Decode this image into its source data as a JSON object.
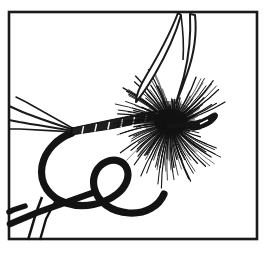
{
  "image": {
    "title": "Dry fly tied on hook",
    "subject": "fishing fly",
    "style": "black and white pen-and-ink line illustration",
    "background_color": "#ffffff",
    "ink_color": "#1a1a1a",
    "width": 272,
    "height": 255
  },
  "frame": {
    "name": "rectangular border",
    "stroke_color": "#1a1a1a",
    "stroke_width": 2.5,
    "x": 9,
    "y": 12,
    "width": 248,
    "height": 227
  },
  "parts": [
    {
      "id": "wings",
      "label": "Wings",
      "description": "two upright pointed feather wings outlined in ink",
      "count": 2,
      "color": "#1a1a1a",
      "center_x": 176,
      "top_y": 13
    },
    {
      "id": "hackle",
      "label": "Hackle",
      "description": "dense radial starburst of fine hackle fibers",
      "fiber_count": 190,
      "color": "#111111",
      "center_x": 171,
      "center_y": 124,
      "radius_x": 56,
      "radius_y": 62
    },
    {
      "id": "body",
      "label": "Body",
      "description": "dark tapered segmented abdomen with light ribbing",
      "rib_count": 7,
      "color": "#1a1a1a",
      "start_x": 70,
      "start_y": 133,
      "end_x": 160,
      "end_y": 120
    },
    {
      "id": "tail",
      "label": "Tail",
      "description": "three long thin tail fibers sweeping to the left",
      "count": 3,
      "color": "#1a1a1a",
      "origin_x": 72,
      "origin_y": 131
    },
    {
      "id": "hook",
      "label": "Hook",
      "description": "heavy curved hook wire bending down and around to the point",
      "color": "#131313",
      "stroke_width": 7
    },
    {
      "id": "hook-point",
      "label": "Hook point and barb",
      "description": "sharp point with barb at lower left, cropped by the frame",
      "color": "#131313"
    },
    {
      "id": "hook-eye",
      "label": "Hook eye",
      "description": "small closed loop at the head, right of the hackle",
      "color": "#131313",
      "x": 207,
      "y": 119
    }
  ]
}
